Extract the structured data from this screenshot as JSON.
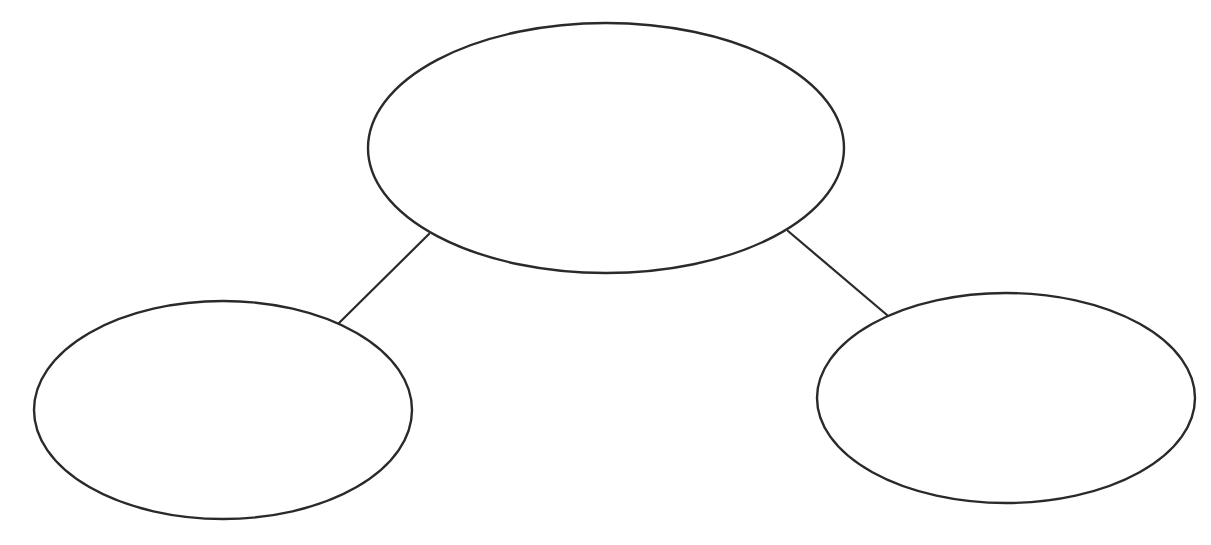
{
  "diagram": {
    "type": "tree",
    "stroke_color": "#2a2a2a",
    "fill_color": "#ffffff",
    "background": "#ffffff",
    "nodes": [
      {
        "id": "top",
        "label": "",
        "cx": 606,
        "cy": 148,
        "rx": 238,
        "ry": 125
      },
      {
        "id": "bottom-left",
        "label": "",
        "cx": 223,
        "cy": 410,
        "rx": 189,
        "ry": 109
      },
      {
        "id": "bottom-right",
        "label": "",
        "cx": 1006,
        "cy": 398,
        "rx": 189,
        "ry": 105
      }
    ],
    "edges": [
      {
        "from": "top",
        "to": "bottom-left",
        "x1": 429,
        "y1": 234,
        "x2": 339,
        "y2": 323
      },
      {
        "from": "top",
        "to": "bottom-right",
        "x1": 788,
        "y1": 231,
        "x2": 887,
        "y2": 315
      }
    ]
  }
}
